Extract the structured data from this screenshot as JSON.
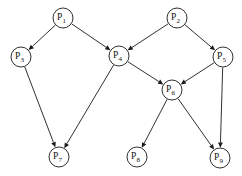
{
  "figure": {
    "kind": "directed-graph",
    "width": 242,
    "height": 176,
    "background_color": "#ffffff",
    "line_color": "#1a1a1a",
    "node_fill_color": "#ffffff",
    "node_radius": 10,
    "arrowhead_style": "solid-triangle"
  },
  "nodes": [
    {
      "id": "P1",
      "base": "P",
      "subscript": "1",
      "label": "P1",
      "x": 63,
      "y": 18
    },
    {
      "id": "P2",
      "base": "P",
      "subscript": "2",
      "label": "P2",
      "x": 177,
      "y": 18
    },
    {
      "id": "P3",
      "base": "P",
      "subscript": "3",
      "label": "P3",
      "x": 21,
      "y": 57
    },
    {
      "id": "P4",
      "base": "P",
      "subscript": "4",
      "label": "P4",
      "x": 119,
      "y": 56
    },
    {
      "id": "P5",
      "base": "P",
      "subscript": "5",
      "label": "P5",
      "x": 223,
      "y": 57
    },
    {
      "id": "P6",
      "base": "P",
      "subscript": "6",
      "label": "P6",
      "x": 172,
      "y": 90
    },
    {
      "id": "P7",
      "base": "P",
      "subscript": "7",
      "label": "P7",
      "x": 59,
      "y": 157
    },
    {
      "id": "P8",
      "base": "P",
      "subscript": "8",
      "label": "P8",
      "x": 137,
      "y": 157
    },
    {
      "id": "P9",
      "base": "P",
      "subscript": "9",
      "label": "P9",
      "x": 220,
      "y": 158
    }
  ],
  "edges": [
    {
      "from": "P1",
      "to": "P3",
      "directed": true
    },
    {
      "from": "P1",
      "to": "P4",
      "directed": true
    },
    {
      "from": "P2",
      "to": "P4",
      "directed": true
    },
    {
      "from": "P2",
      "to": "P5",
      "directed": true
    },
    {
      "from": "P3",
      "to": "P7",
      "directed": true
    },
    {
      "from": "P4",
      "to": "P7",
      "directed": true
    },
    {
      "from": "P4",
      "to": "P6",
      "directed": true
    },
    {
      "from": "P5",
      "to": "P6",
      "directed": true
    },
    {
      "from": "P5",
      "to": "P9",
      "directed": true
    },
    {
      "from": "P6",
      "to": "P8",
      "directed": true
    },
    {
      "from": "P6",
      "to": "P9",
      "directed": true
    }
  ]
}
